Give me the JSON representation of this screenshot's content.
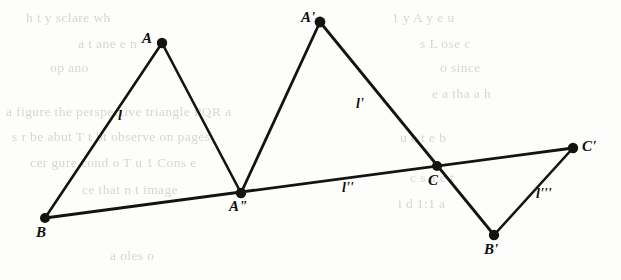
{
  "figure": {
    "stroke_color": "#15130f",
    "background_color": "#fdfdfc",
    "width": 621,
    "height": 280,
    "vertices": [
      {
        "id": "A",
        "label": "A",
        "x": 162,
        "y": 43,
        "label_x": 142,
        "label_y": 30,
        "radius": 5.2
      },
      {
        "id": "B",
        "label": "B",
        "x": 45,
        "y": 218,
        "label_x": 36,
        "label_y": 224,
        "radius": 5.0
      },
      {
        "id": "A2",
        "label": "A\"",
        "x": 241,
        "y": 193,
        "label_x": 229,
        "label_y": 198,
        "radius": 5.2
      },
      {
        "id": "Aprime",
        "label": "A'",
        "x": 320,
        "y": 22,
        "label_x": 301,
        "label_y": 9,
        "radius": 5.4
      },
      {
        "id": "C",
        "label": "C",
        "x": 437,
        "y": 166,
        "label_x": 428,
        "label_y": 172,
        "radius": 5.0
      },
      {
        "id": "Bprime",
        "label": "B'",
        "x": 494,
        "y": 235,
        "label_x": 484,
        "label_y": 241,
        "radius": 5.2
      },
      {
        "id": "Cprime",
        "label": "C'",
        "x": 573,
        "y": 148,
        "label_x": 582,
        "label_y": 138,
        "radius": 5.2
      }
    ],
    "segments": [
      {
        "id": "seg-B-A",
        "from": "B",
        "to": "A",
        "width": 2.6
      },
      {
        "id": "seg-A-A2",
        "from": "A",
        "to": "A2",
        "width": 2.6
      },
      {
        "id": "seg-A2-Aprime",
        "from": "A2",
        "to": "Aprime",
        "width": 2.8
      },
      {
        "id": "seg-Aprime-Bprime",
        "from": "Aprime",
        "to": "Bprime",
        "width": 2.8
      },
      {
        "id": "seg-B-Cprime",
        "from": "B",
        "to": "Cprime",
        "width": 2.8
      },
      {
        "id": "seg-Bprime-Cprime",
        "from": "Bprime",
        "to": "Cprime",
        "width": 2.6
      }
    ],
    "line_labels": [
      {
        "id": "label-l",
        "text": "l",
        "x": 118,
        "y": 108
      },
      {
        "id": "label-lp",
        "text": "l'",
        "x": 356,
        "y": 96
      },
      {
        "id": "label-lpp",
        "text": "l''",
        "x": 342,
        "y": 180
      },
      {
        "id": "label-lppp",
        "text": "l'''",
        "x": 536,
        "y": 186
      }
    ]
  },
  "ghost_text": {
    "description": "faint show-through text from reverse page",
    "left_lines": [
      "h  t   y   sclare  wh",
      "a   t    ane    e  n",
      "op     ano",
      "a  figure  the perspective triangle  PQR a",
      "s  r  be  abut  T  t  bt  observe  on  pages",
      "cer  gure  cond  o  T  u  1  Cons  e",
      "ce      that   n   t   image",
      "a    oles  o"
    ],
    "right_lines": [
      "1  y    A    y   e  u",
      "s    L  ose   c",
      "o    since",
      "e    a  tha    a  h",
      "u  e   t   e  b",
      "c  s  a   e  t",
      "i  d  1:1  a"
    ]
  }
}
